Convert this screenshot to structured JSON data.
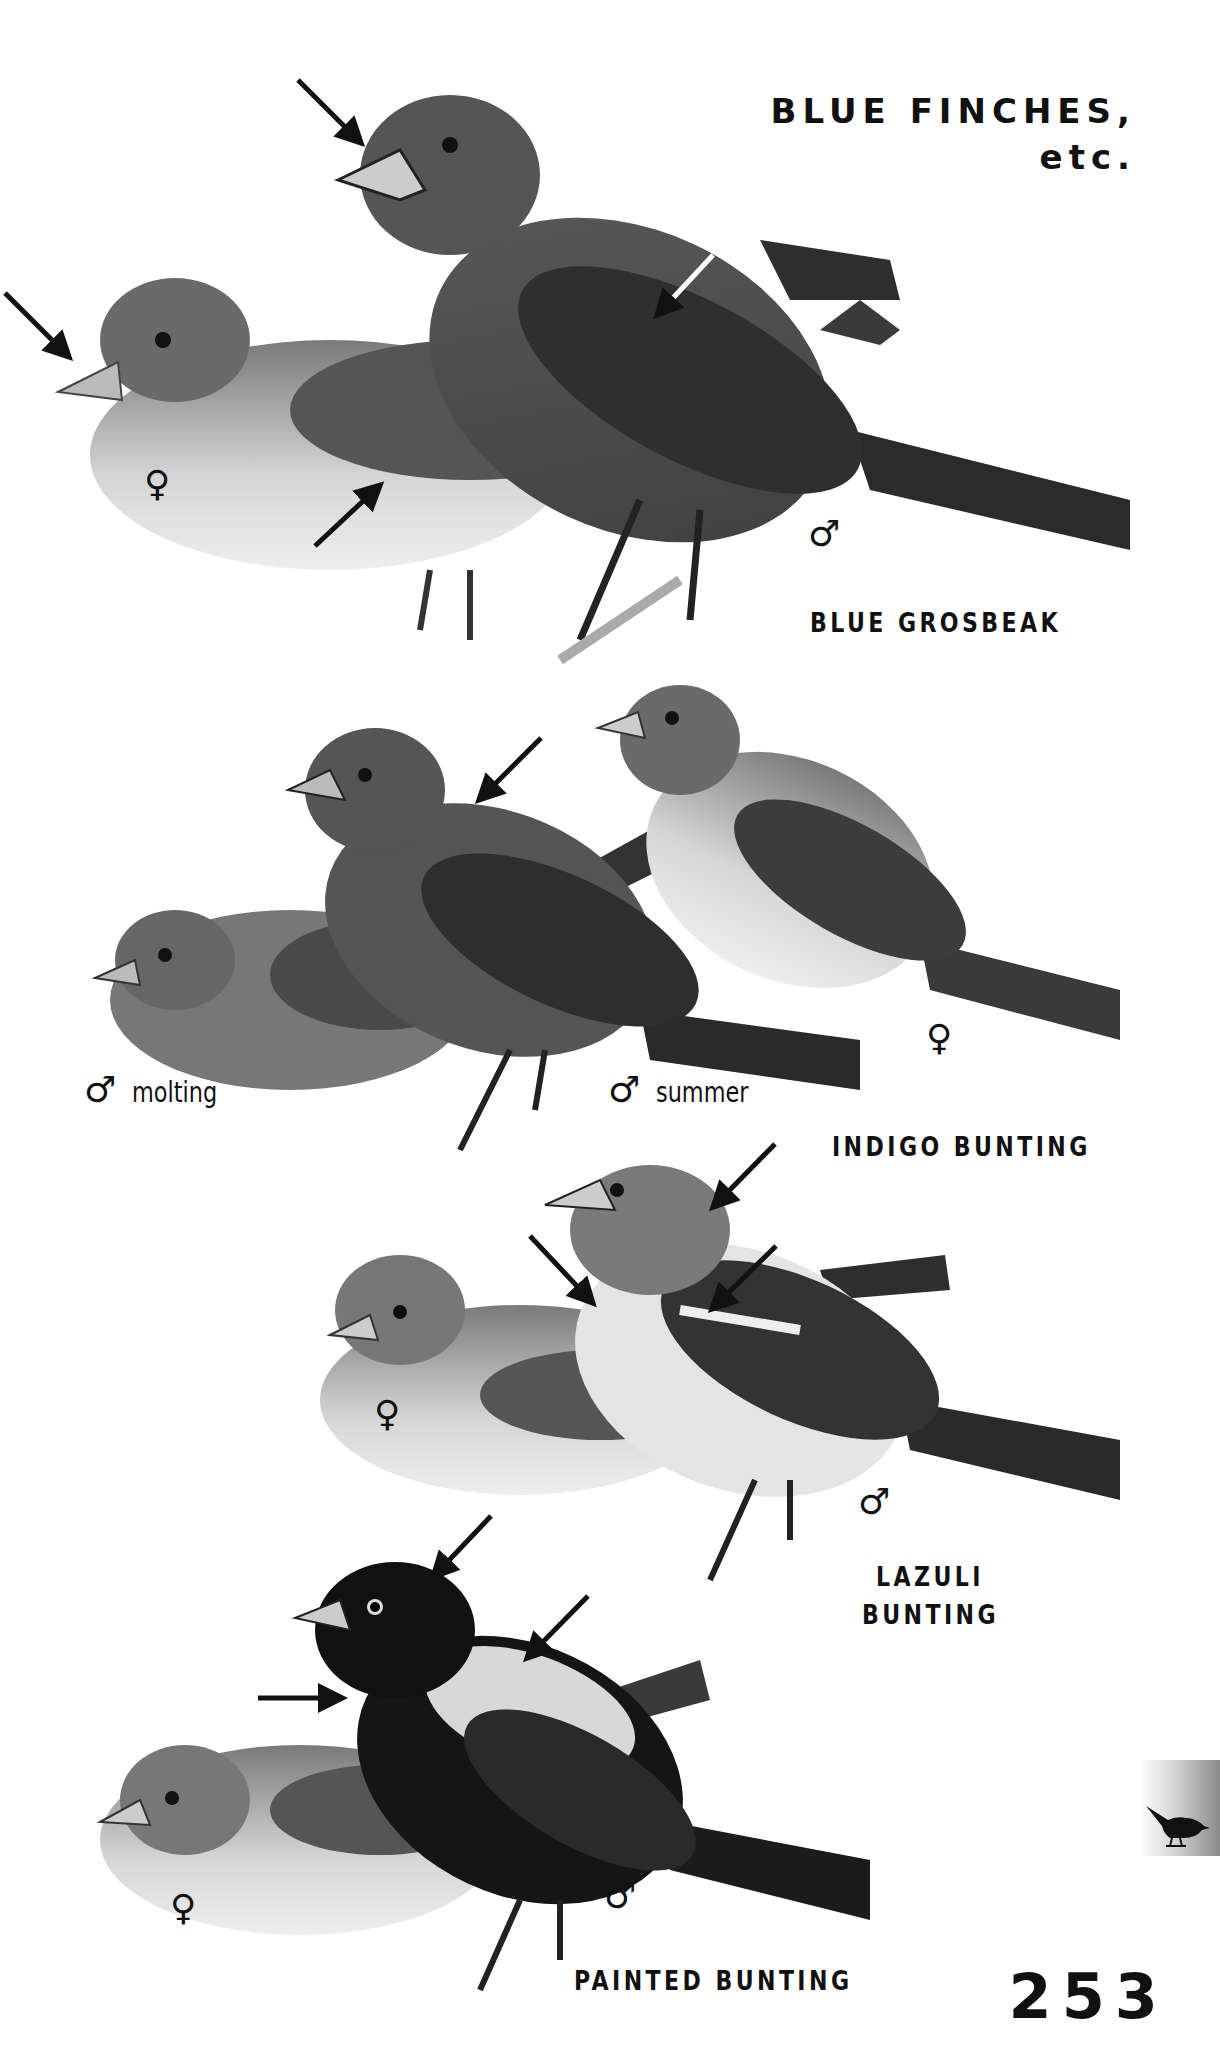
{
  "page": {
    "title_line1": "BLUE FINCHES,",
    "title_line2": "etc.",
    "page_number": "253",
    "section_tab_icon": "songbird-silhouette-icon"
  },
  "symbols": {
    "male": "♂",
    "female": "♀"
  },
  "groups": [
    {
      "species": "BLUE GROSBEAK",
      "birds": [
        {
          "sex": "female",
          "label": "♀",
          "caption": ""
        },
        {
          "sex": "male",
          "label": "♂",
          "caption": ""
        }
      ],
      "arrows": 4
    },
    {
      "species": "INDIGO BUNTING",
      "birds": [
        {
          "sex": "male",
          "label": "♂",
          "caption": "molting"
        },
        {
          "sex": "male",
          "label": "♂",
          "caption": "summer"
        },
        {
          "sex": "female",
          "label": "♀",
          "caption": ""
        }
      ],
      "arrows": 1
    },
    {
      "species_line1": "LAZULI",
      "species_line2": "BUNTING",
      "birds": [
        {
          "sex": "female",
          "label": "♀",
          "caption": ""
        },
        {
          "sex": "male",
          "label": "♂",
          "caption": ""
        }
      ],
      "arrows": 3
    },
    {
      "species": "PAINTED BUNTING",
      "birds": [
        {
          "sex": "female",
          "label": "♀",
          "caption": ""
        },
        {
          "sex": "male",
          "label": "♂",
          "caption": ""
        }
      ],
      "arrows": 3
    }
  ],
  "colors": {
    "ink": "#111111",
    "paper": "#ffffff",
    "bird_dark": "#3a3a3a",
    "bird_mid": "#6e6e6e",
    "bird_light": "#bdbdbd",
    "bird_pale": "#e6e6e6"
  }
}
